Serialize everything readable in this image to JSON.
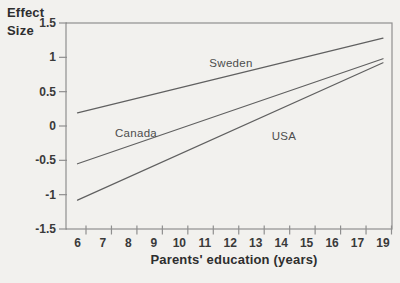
{
  "figure": {
    "ylabel_line1": "Effect",
    "ylabel_line2": "Size",
    "xlabel": "Parents' education (years)"
  },
  "chart_data": {
    "type": "line",
    "title": "",
    "ylabel": "Effect Size",
    "xlabel": "Parents' education (years)",
    "x_tick_labels": [
      "6",
      "7",
      "8",
      "9",
      "10",
      "11",
      "12",
      "13",
      "14",
      "15",
      "16",
      "17",
      "19"
    ],
    "y_ticks": [
      1.5,
      1,
      0.5,
      0,
      -0.5,
      -1,
      -1.5
    ],
    "y_tick_labels": [
      "1.5",
      "1",
      "0.5",
      "0",
      "-0.5",
      "-1",
      "-1.5"
    ],
    "ylim": [
      -1.5,
      1.5
    ],
    "xlim_labels": [
      6,
      19
    ],
    "grid": false,
    "legend": "inline-labels",
    "series": [
      {
        "name": "Sweden",
        "x": [
          6,
          19
        ],
        "values": [
          0.19,
          1.28
        ]
      },
      {
        "name": "Canada",
        "x": [
          6,
          19
        ],
        "values": [
          -0.55,
          0.98
        ]
      },
      {
        "name": "USA",
        "x": [
          6,
          19
        ],
        "values": [
          -1.08,
          0.92
        ]
      }
    ],
    "series_label_pos": [
      [
        231,
        63
      ],
      [
        136,
        133
      ],
      [
        284,
        136
      ]
    ],
    "colors": {
      "line": "#606060",
      "axis": "#8f8f8f",
      "text": "#3a3a3a",
      "series_label": "#4d4d4d",
      "background": "#f2f1ee"
    }
  }
}
